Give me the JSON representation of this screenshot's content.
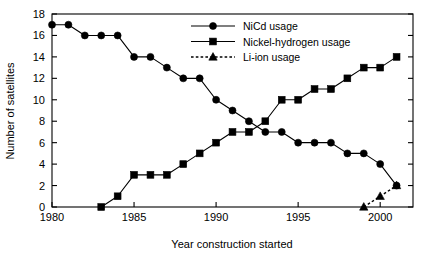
{
  "chart_data": {
    "type": "line",
    "title": "",
    "xlabel": "Year construction started",
    "ylabel": "Number of satellites",
    "xlim": [
      1980,
      2002
    ],
    "ylim": [
      0,
      18
    ],
    "xticks": [
      1980,
      1985,
      1990,
      1995,
      2000
    ],
    "xtick_labels": [
      "1980",
      "1985",
      "1990",
      "1995",
      "2000"
    ],
    "yticks": [
      0,
      2,
      4,
      6,
      8,
      10,
      12,
      14,
      16,
      18
    ],
    "ytick_labels": [
      "0",
      "2",
      "4",
      "6",
      "8",
      "10",
      "12",
      "14",
      "16",
      "18"
    ],
    "grid": false,
    "legend_position": "top-center-right",
    "x": [
      1980,
      1981,
      1982,
      1983,
      1984,
      1985,
      1986,
      1987,
      1988,
      1989,
      1990,
      1991,
      1992,
      1993,
      1994,
      1995,
      1996,
      1997,
      1998,
      1999,
      2000,
      2001
    ],
    "series": [
      {
        "name": "NiCd usage",
        "marker": "circle",
        "line_style": "solid",
        "color": "#000000",
        "x": [
          1980,
          1981,
          1982,
          1983,
          1984,
          1985,
          1986,
          1987,
          1988,
          1989,
          1990,
          1991,
          1992,
          1993,
          1994,
          1995,
          1996,
          1997,
          1998,
          1999,
          2000,
          2001
        ],
        "values": [
          17,
          17,
          16,
          16,
          16,
          14,
          14,
          13,
          12,
          12,
          10,
          9,
          8,
          7,
          7,
          6,
          6,
          6,
          5,
          5,
          4,
          2
        ]
      },
      {
        "name": "Nickel-hydrogen usage",
        "marker": "square",
        "line_style": "solid",
        "color": "#000000",
        "x": [
          1983,
          1984,
          1985,
          1986,
          1987,
          1988,
          1989,
          1990,
          1991,
          1992,
          1993,
          1994,
          1995,
          1996,
          1997,
          1998,
          1999,
          2000,
          2001
        ],
        "values": [
          0,
          1,
          3,
          3,
          3,
          4,
          5,
          6,
          7,
          7,
          8,
          10,
          10,
          11,
          11,
          12,
          13,
          13,
          14
        ]
      },
      {
        "name": "Li-ion usage",
        "marker": "triangle",
        "line_style": "dotted",
        "color": "#000000",
        "x": [
          1999,
          2000,
          2001
        ],
        "values": [
          0,
          1,
          2
        ]
      }
    ]
  },
  "legend": {
    "entries": [
      {
        "label": "NiCd usage",
        "marker": "circle",
        "line_style": "solid"
      },
      {
        "label": "Nickel-hydrogen usage",
        "marker": "square",
        "line_style": "solid"
      },
      {
        "label": "Li-ion usage",
        "marker": "triangle",
        "line_style": "dotted"
      }
    ]
  }
}
